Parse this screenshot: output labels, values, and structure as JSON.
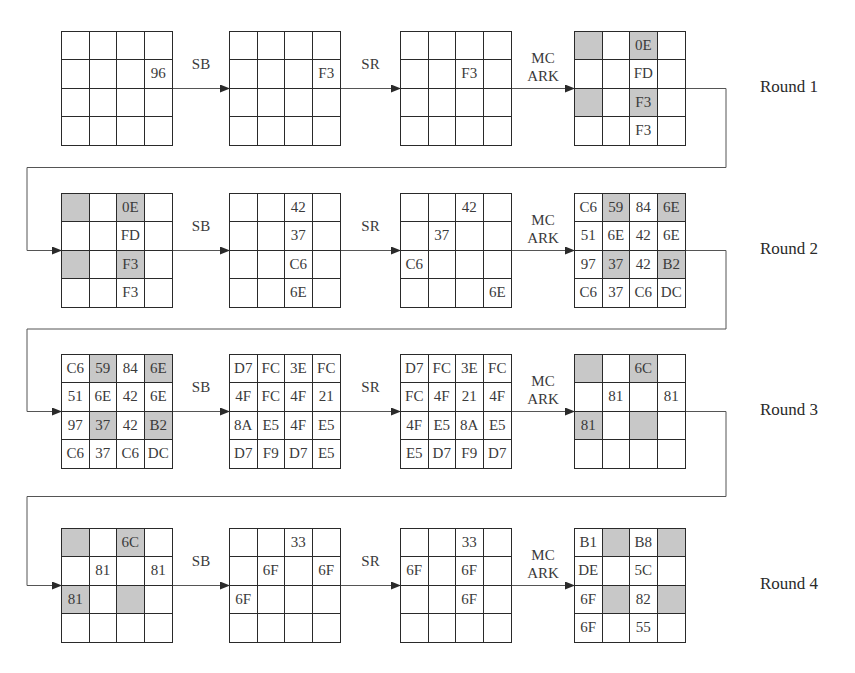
{
  "diagram": {
    "operations": {
      "sb": "SB",
      "sr": "SR",
      "mc": "MC",
      "ark": "ARK"
    },
    "colors": {
      "shade": "#c8c8c8",
      "line": "#2a2a2a"
    },
    "rounds": [
      {
        "label": "Round 1",
        "states": [
          {
            "cells": [
              [
                "",
                "",
                "",
                ""
              ],
              [
                "",
                "",
                "",
                "96"
              ],
              [
                "",
                "",
                "",
                ""
              ],
              [
                "",
                "",
                "",
                ""
              ]
            ],
            "shaded": []
          },
          {
            "cells": [
              [
                "",
                "",
                "",
                ""
              ],
              [
                "",
                "",
                "",
                "F3"
              ],
              [
                "",
                "",
                "",
                ""
              ],
              [
                "",
                "",
                "",
                ""
              ]
            ],
            "shaded": []
          },
          {
            "cells": [
              [
                "",
                "",
                "",
                ""
              ],
              [
                "",
                "",
                "F3",
                ""
              ],
              [
                "",
                "",
                "",
                ""
              ],
              [
                "",
                "",
                "",
                ""
              ]
            ],
            "shaded": []
          },
          {
            "cells": [
              [
                "",
                "",
                "0E",
                ""
              ],
              [
                "",
                "",
                "FD",
                ""
              ],
              [
                "",
                "",
                "F3",
                ""
              ],
              [
                "",
                "",
                "F3",
                ""
              ]
            ],
            "shaded": [
              [
                0,
                0
              ],
              [
                0,
                2
              ],
              [
                2,
                0
              ],
              [
                2,
                2
              ]
            ]
          }
        ]
      },
      {
        "label": "Round 2",
        "states": [
          {
            "cells": [
              [
                "",
                "",
                "0E",
                ""
              ],
              [
                "",
                "",
                "FD",
                ""
              ],
              [
                "",
                "",
                "F3",
                ""
              ],
              [
                "",
                "",
                "F3",
                ""
              ]
            ],
            "shaded": [
              [
                0,
                0
              ],
              [
                0,
                2
              ],
              [
                2,
                0
              ],
              [
                2,
                2
              ]
            ]
          },
          {
            "cells": [
              [
                "",
                "",
                "42",
                ""
              ],
              [
                "",
                "",
                "37",
                ""
              ],
              [
                "",
                "",
                "C6",
                ""
              ],
              [
                "",
                "",
                "6E",
                ""
              ]
            ],
            "shaded": []
          },
          {
            "cells": [
              [
                "",
                "",
                "42",
                ""
              ],
              [
                "",
                "37",
                "",
                ""
              ],
              [
                "C6",
                "",
                "",
                ""
              ],
              [
                "",
                "",
                "",
                "6E"
              ]
            ],
            "shaded": []
          },
          {
            "cells": [
              [
                "C6",
                "59",
                "84",
                "6E"
              ],
              [
                "51",
                "6E",
                "42",
                "6E"
              ],
              [
                "97",
                "37",
                "42",
                "B2"
              ],
              [
                "C6",
                "37",
                "C6",
                "DC"
              ]
            ],
            "shaded": [
              [
                0,
                1
              ],
              [
                0,
                3
              ],
              [
                2,
                1
              ],
              [
                2,
                3
              ]
            ]
          }
        ]
      },
      {
        "label": "Round 3",
        "states": [
          {
            "cells": [
              [
                "C6",
                "59",
                "84",
                "6E"
              ],
              [
                "51",
                "6E",
                "42",
                "6E"
              ],
              [
                "97",
                "37",
                "42",
                "B2"
              ],
              [
                "C6",
                "37",
                "C6",
                "DC"
              ]
            ],
            "shaded": [
              [
                0,
                1
              ],
              [
                0,
                3
              ],
              [
                2,
                1
              ],
              [
                2,
                3
              ]
            ]
          },
          {
            "cells": [
              [
                "D7",
                "FC",
                "3E",
                "FC"
              ],
              [
                "4F",
                "FC",
                "4F",
                "21"
              ],
              [
                "8A",
                "E5",
                "4F",
                "E5"
              ],
              [
                "D7",
                "F9",
                "D7",
                "E5"
              ]
            ],
            "shaded": []
          },
          {
            "cells": [
              [
                "D7",
                "FC",
                "3E",
                "FC"
              ],
              [
                "FC",
                "4F",
                "21",
                "4F"
              ],
              [
                "4F",
                "E5",
                "8A",
                "E5"
              ],
              [
                "E5",
                "D7",
                "F9",
                "D7"
              ]
            ],
            "shaded": []
          },
          {
            "cells": [
              [
                "",
                "",
                "6C",
                ""
              ],
              [
                "",
                "81",
                "",
                "81"
              ],
              [
                "81",
                "",
                "",
                ""
              ],
              [
                "",
                "",
                "",
                ""
              ]
            ],
            "shaded": [
              [
                0,
                0
              ],
              [
                0,
                2
              ],
              [
                2,
                0
              ],
              [
                2,
                2
              ]
            ]
          }
        ]
      },
      {
        "label": "Round 4",
        "states": [
          {
            "cells": [
              [
                "",
                "",
                "6C",
                ""
              ],
              [
                "",
                "81",
                "",
                "81"
              ],
              [
                "81",
                "",
                "",
                ""
              ],
              [
                "",
                "",
                "",
                ""
              ]
            ],
            "shaded": [
              [
                0,
                0
              ],
              [
                0,
                2
              ],
              [
                2,
                0
              ],
              [
                2,
                2
              ]
            ]
          },
          {
            "cells": [
              [
                "",
                "",
                "33",
                ""
              ],
              [
                "",
                "6F",
                "",
                "6F"
              ],
              [
                "6F",
                "",
                "",
                ""
              ],
              [
                "",
                "",
                "",
                ""
              ]
            ],
            "shaded": []
          },
          {
            "cells": [
              [
                "",
                "",
                "33",
                ""
              ],
              [
                "6F",
                "",
                "6F",
                ""
              ],
              [
                "",
                "",
                "6F",
                ""
              ],
              [
                "",
                "",
                "",
                ""
              ]
            ],
            "shaded": []
          },
          {
            "cells": [
              [
                "B1",
                "",
                "B8",
                ""
              ],
              [
                "DE",
                "",
                "5C",
                ""
              ],
              [
                "6F",
                "",
                "82",
                ""
              ],
              [
                "6F",
                "",
                "55",
                ""
              ]
            ],
            "shaded": [
              [
                0,
                1
              ],
              [
                0,
                3
              ],
              [
                2,
                1
              ],
              [
                2,
                3
              ]
            ]
          }
        ]
      }
    ]
  }
}
